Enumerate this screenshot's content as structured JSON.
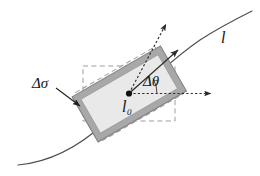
{
  "figure": {
    "domain_note": "line-diagram",
    "labels": {
      "delta_sigma": "Δσ",
      "delta_theta": "Δθ",
      "l_zero_main": "l",
      "l_zero_sub": "0",
      "line_l": "l"
    },
    "colors": {
      "background": "#ffffff",
      "stroke": "#3a3a3a",
      "curve": "#4a4a4a",
      "rect_fill": "#e9e9e9",
      "rect_band": "#a6a6a6",
      "rect_band_edge": "#8a8a8a",
      "dashed": "#9a9a9a",
      "dotted": "#2f2f2f",
      "label": "#141414"
    },
    "elements": {
      "curve": "smooth arc rising from lower-left to upper-right",
      "solid_rectangle": "tilted shaded rectangle with thick gray border band",
      "dashed_rectangle_axis_aligned": "axis aligned dashed box behind element",
      "dashed_rectangle_tilted": "tilted dashed box rotated by delta theta",
      "arrow_tangent": "solid arrow along the curve direction",
      "arrow_normal_dotted": "dotted arrow normal to element",
      "arrow_horizontal_dotted": "dotted horizontal reference arrow",
      "arrow_delta_sigma": "leader arrow pointing to rectangle corner",
      "center_dot": "filled point marking l0"
    }
  }
}
